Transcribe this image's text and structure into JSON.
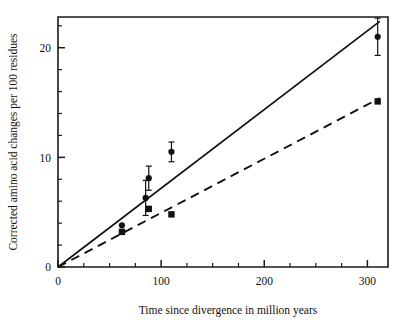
{
  "figure": {
    "background": "#ffffff",
    "ink_color": "#111111"
  },
  "chart_data": {
    "type": "scatter",
    "title": "",
    "subtitle": "",
    "xlabel": "Time since divergence in million years",
    "ylabel": "Corrected amino acid changes per 100 residues",
    "xlim": [
      0,
      320
    ],
    "ylim": [
      0,
      22.8
    ],
    "grid": false,
    "legend": "none",
    "x_ticks_major": [
      0,
      100,
      200,
      300
    ],
    "x_tick_labels": [
      "0",
      "100",
      "200",
      "300"
    ],
    "x_ticks_minor": [
      25,
      50,
      75,
      125,
      150,
      175,
      225,
      250,
      275
    ],
    "y_ticks_major": [
      0,
      10,
      20
    ],
    "y_tick_labels": [
      "0",
      "10",
      "20"
    ],
    "y_ticks_minor": [
      2,
      4,
      6,
      8,
      12,
      14,
      16,
      18,
      22
    ],
    "series": [
      {
        "name": "circles",
        "marker": "circle",
        "points": [
          {
            "x": 62,
            "y": 3.8,
            "yerr": 0.0
          },
          {
            "x": 85,
            "y": 6.3,
            "yerr": 1.6
          },
          {
            "x": 88,
            "y": 8.1,
            "yerr": 1.1
          },
          {
            "x": 110,
            "y": 10.5,
            "yerr": 0.9
          },
          {
            "x": 310,
            "y": 21.0,
            "yerr": 1.7
          }
        ]
      },
      {
        "name": "squares",
        "marker": "square",
        "points": [
          {
            "x": 62,
            "y": 3.2,
            "yerr": 0.0
          },
          {
            "x": 88,
            "y": 5.3,
            "yerr": 0.0
          },
          {
            "x": 110,
            "y": 4.8,
            "yerr": 0.0
          },
          {
            "x": 310,
            "y": 15.1,
            "yerr": 0.0
          }
        ]
      }
    ],
    "fits": [
      {
        "name": "solid-regression-line",
        "style": "solid",
        "x_start": 0,
        "y_start": 0.0,
        "x_end": 312,
        "y_end": 22.4
      },
      {
        "name": "dashed-regression-line",
        "style": "dashed",
        "x_start": 0,
        "y_start": 0.0,
        "x_end": 312,
        "y_end": 15.4
      }
    ]
  }
}
